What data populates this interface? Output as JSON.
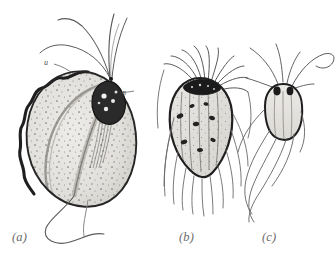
{
  "figure": {
    "domain_subject": "flagellate-protozoa-illustration",
    "background_color": "#ffffff",
    "ink_color": "#2b2b2b",
    "cytoplasm_fill": "#e4e2de",
    "nucleus_color": "#1a1a1a",
    "flagella_color": "#555555",
    "caption_color": "#6b6b6b"
  },
  "captions": [
    {
      "id": "a",
      "text": "(a)"
    },
    {
      "id": "b",
      "text": "(b)"
    },
    {
      "id": "c",
      "text": "(c)"
    }
  ],
  "labels": [
    {
      "id": "u",
      "text": "u",
      "meaning": "undulating-membrane"
    },
    {
      "id": "n",
      "text": "n",
      "meaning": "nucleus"
    }
  ],
  "panels": [
    {
      "id": "a",
      "name": "large-ovoid-flagellate",
      "description": "Large ovoid cell with wavy undulating membrane on the left margin, stippled granular cytoplasm, dark nucleus near the apex, four long anterior flagella arcing upward and one wavy trailing posterior flagellum.",
      "flagella_count_anterior": 4,
      "flagella_count_posterior": 1,
      "has_undulating_membrane": true,
      "has_nucleus": true,
      "has_stippling": true
    },
    {
      "id": "b",
      "name": "rounded-multiflagellate",
      "description": "Rounded heart-shaped cell with a dark crown of basal bodies at the apex and numerous fine flagella arcing outward and draping downward around the body.",
      "flagella_count_anterior": 10,
      "flagella_count_posterior": 12,
      "has_undulating_membrane": false,
      "has_nucleus": false,
      "has_stippling": true
    },
    {
      "id": "c",
      "name": "small-elongate-flagellate",
      "description": "Small elongate cell with two dark apical granules, several flagella emerging from the apex, one long flagellum curling up to the right and long crossing flagella trailing down to the lower left.",
      "flagella_count_anterior": 5,
      "flagella_count_posterior": 4,
      "has_undulating_membrane": false,
      "has_nucleus": false,
      "has_stippling": false
    }
  ]
}
